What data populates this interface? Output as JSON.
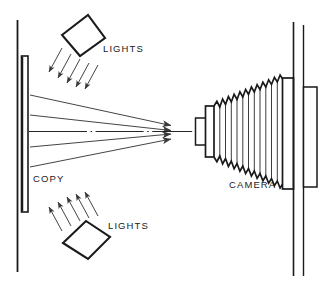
{
  "diagram": {
    "type": "optical-copystand-schematic",
    "canvas": {
      "width": 331,
      "height": 290
    },
    "colors": {
      "background": "#ffffff",
      "stroke": "#1a1a1a",
      "ray_stroke": "#3a3a3a",
      "text": "#1a1a1a"
    },
    "labels": {
      "copy": "COPY",
      "camera": "CAMERA",
      "lights_top": "LIGHTS",
      "lights_bottom": "LIGHTS"
    },
    "parts": {
      "left_wall": {
        "name": "left-wall",
        "x": 17,
        "y_top": 20,
        "y_bottom": 272
      },
      "copy_board": {
        "name": "copy-board",
        "x": 22,
        "y": 56,
        "width": 6,
        "height": 156
      },
      "right_wall_inner": {
        "name": "right-wall-inner",
        "x": 293,
        "y_top": 22,
        "y_bottom": 276
      },
      "right_wall_outer": {
        "name": "right-wall-outer",
        "x": 303,
        "y_top": 25,
        "y_bottom": 276
      },
      "camera_back_plate": {
        "name": "camera-back-plate",
        "x": 283,
        "y": 78,
        "width": 11,
        "height": 110
      },
      "film_holder": {
        "name": "film-holder",
        "x": 303,
        "y": 87,
        "width": 13,
        "height": 100
      },
      "lens_barrel": {
        "name": "lens-barrel",
        "x": 196,
        "y": 117,
        "width": 10,
        "height": 28
      },
      "lens_flange": {
        "name": "lens-flange",
        "x": 206,
        "y": 106,
        "width": 8,
        "height": 50
      },
      "bellows": {
        "name": "bellows",
        "x_start": 214,
        "x_end": 283,
        "folds": 12,
        "half_height_start": 26,
        "half_height_end": 56,
        "center_y": 131
      }
    },
    "light_fixtures": [
      {
        "name": "top-light",
        "label": "LIGHTS",
        "label_x": 103,
        "label_y": 52,
        "beam_count": 5,
        "beam_direction": "down-left"
      },
      {
        "name": "bottom-light",
        "label": "LIGHTS",
        "label_x": 105,
        "label_y": 229,
        "beam_count": 5,
        "beam_direction": "up-left"
      }
    ],
    "optical_rays": {
      "name": "converging-rays",
      "count": 5,
      "origin_x": 30,
      "target_x": 172,
      "target_center_y": 131,
      "origin_y_values": [
        95,
        115,
        131,
        147,
        166
      ],
      "axis_line_style": "dash-dot"
    }
  }
}
